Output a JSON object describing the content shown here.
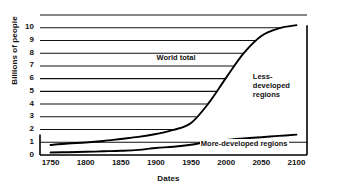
{
  "chart_data": {
    "type": "line",
    "title": "",
    "xlabel": "Dates",
    "ylabel": "Billions of people",
    "xlim": [
      1735,
      2115
    ],
    "ylim": [
      0,
      11
    ],
    "grid": true,
    "legend_position": "inline-annotations",
    "xticks": [
      1750,
      1800,
      1850,
      1900,
      1950,
      2000,
      2050,
      2100
    ],
    "yticks": [
      0,
      1,
      2,
      3,
      4,
      5,
      6,
      7,
      8,
      9,
      10
    ],
    "x": [
      1750,
      1775,
      1800,
      1825,
      1850,
      1875,
      1900,
      1925,
      1950,
      1975,
      2000,
      2025,
      2050,
      2075,
      2100
    ],
    "series": [
      {
        "name": "World total",
        "values": [
          0.79,
          0.9,
          0.98,
          1.1,
          1.26,
          1.42,
          1.65,
          1.97,
          2.52,
          4.07,
          6.08,
          8.0,
          9.35,
          9.95,
          10.2
        ]
      },
      {
        "name": "More-developed regions",
        "values": [
          0.2,
          0.22,
          0.25,
          0.29,
          0.33,
          0.4,
          0.55,
          0.65,
          0.81,
          1.05,
          1.19,
          1.3,
          1.4,
          1.5,
          1.6
        ]
      }
    ],
    "annotations": [
      {
        "id": "world-total",
        "text": "World total",
        "x": 1965,
        "y": 7.6
      },
      {
        "id": "less-developed",
        "text": "Less-\ndeveloped\nregions",
        "x": 2055,
        "y": 5.6
      },
      {
        "id": "more-developed",
        "text": "More-developed regions",
        "x": 2065,
        "y": 0.85
      }
    ],
    "colors": {
      "background": "#ffffff",
      "axis": "#000000",
      "gridline": "#111111",
      "world_total_line": "#000000",
      "more_developed_line": "#000000",
      "text": "#111111"
    }
  },
  "labels": {
    "y_axis_title": "Billions of people",
    "x_axis_title": "Dates",
    "yticks": [
      "0",
      "1",
      "2",
      "3",
      "4",
      "5",
      "6",
      "7",
      "8",
      "9",
      "10"
    ],
    "xticks": [
      "1750",
      "1800",
      "1850",
      "1900",
      "1950",
      "2000",
      "2050",
      "2100"
    ],
    "ann_world_total": "World total",
    "ann_less_1": "Less-",
    "ann_less_2": "developed",
    "ann_less_3": "regions",
    "ann_more": "More-developed regions"
  }
}
